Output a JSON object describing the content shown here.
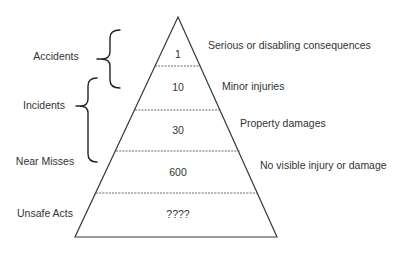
{
  "diagram": {
    "type": "pyramid",
    "colors": {
      "outline": "#3a3a3a",
      "divider": "#555555",
      "text": "#333333",
      "background": "#ffffff"
    },
    "tiers": [
      {
        "value": "1",
        "description": "Serious or disabling consequences"
      },
      {
        "value": "10",
        "description": "Minor injuries"
      },
      {
        "value": "30",
        "description": "Property damages"
      },
      {
        "value": "600",
        "description": "No visible injury or damage"
      },
      {
        "value": "????",
        "description": ""
      }
    ],
    "left_labels": {
      "accidents": "Accidents",
      "incidents": "Incidents",
      "near_misses": "Near Misses",
      "unsafe_acts": "Unsafe Acts"
    },
    "braces": [
      {
        "label": "Accidents",
        "spans_tiers": [
          "1",
          "10"
        ]
      },
      {
        "label": "Incidents",
        "spans_tiers": [
          "10",
          "30"
        ]
      }
    ]
  }
}
